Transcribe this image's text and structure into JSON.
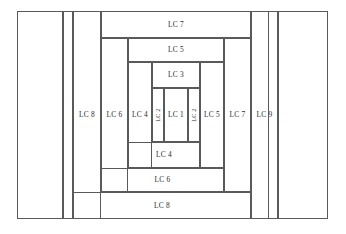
{
  "diagram": {
    "line_color": "#5a5a5a",
    "background_color": "#ffffff",
    "label_color": "#2b2b2b",
    "blocks": [
      {
        "id": "outer-left-panel",
        "label": "",
        "x": 17,
        "y": 11,
        "w": 46,
        "h": 208,
        "orient": "horizontal"
      },
      {
        "id": "outer-left-gap",
        "label": "",
        "x": 63,
        "y": 11,
        "w": 10,
        "h": 208,
        "orient": "horizontal"
      },
      {
        "id": "lc8-left",
        "label": "LC 8",
        "x": 73,
        "y": 11,
        "w": 28,
        "h": 208,
        "orient": "horizontal"
      },
      {
        "id": "lc9-right",
        "label": "LC 9",
        "x": 251,
        "y": 11,
        "w": 27,
        "h": 208,
        "orient": "horizontal"
      },
      {
        "id": "outer-right-gap",
        "label": "",
        "x": 268,
        "y": 11,
        "w": 10,
        "h": 208,
        "orient": "horizontal"
      },
      {
        "id": "outer-right-panel",
        "label": "",
        "x": 278,
        "y": 11,
        "w": 50,
        "h": 208,
        "orient": "horizontal"
      },
      {
        "id": "lc7-top",
        "label": "LC 7",
        "x": 101,
        "y": 11,
        "w": 150,
        "h": 27,
        "orient": "horizontal"
      },
      {
        "id": "lc8-bottom",
        "label": "LC 8",
        "x": 73,
        "y": 192,
        "w": 178,
        "h": 27,
        "orient": "horizontal"
      },
      {
        "id": "lc7-right",
        "label": "LC 7",
        "x": 224,
        "y": 38,
        "w": 27,
        "h": 154,
        "orient": "horizontal"
      },
      {
        "id": "lc6-left",
        "label": "LC 6",
        "x": 101,
        "y": 38,
        "w": 27,
        "h": 154,
        "orient": "horizontal"
      },
      {
        "id": "lc5-top",
        "label": "LC 5",
        "x": 128,
        "y": 38,
        "w": 96,
        "h": 24,
        "orient": "horizontal"
      },
      {
        "id": "lc6-bottom",
        "label": "LC 6",
        "x": 101,
        "y": 168,
        "w": 123,
        "h": 24,
        "orient": "horizontal"
      },
      {
        "id": "lc5-right",
        "label": "LC 5",
        "x": 200,
        "y": 62,
        "w": 24,
        "h": 106,
        "orient": "horizontal"
      },
      {
        "id": "lc4-left",
        "label": "LC 4",
        "x": 128,
        "y": 62,
        "w": 24,
        "h": 106,
        "orient": "horizontal"
      },
      {
        "id": "lc3-top",
        "label": "LC 3",
        "x": 152,
        "y": 62,
        "w": 48,
        "h": 26,
        "orient": "horizontal"
      },
      {
        "id": "lc4-bottom",
        "label": "LC 4",
        "x": 128,
        "y": 142,
        "w": 72,
        "h": 26,
        "orient": "horizontal"
      },
      {
        "id": "lc2-right",
        "label": "LC 2",
        "x": 188,
        "y": 88,
        "w": 12,
        "h": 54,
        "orient": "vertical"
      },
      {
        "id": "lc2-left",
        "label": "LC 2",
        "x": 152,
        "y": 88,
        "w": 12,
        "h": 54,
        "orient": "vertical"
      },
      {
        "id": "lc1-center",
        "label": "LC 1",
        "x": 164,
        "y": 88,
        "w": 24,
        "h": 54,
        "orient": "horizontal"
      }
    ]
  }
}
